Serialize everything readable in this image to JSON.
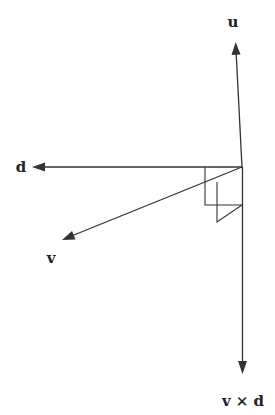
{
  "diagram": {
    "title": "",
    "origin": {
      "x": 242,
      "y": 167
    },
    "vectors": [
      {
        "name": "u",
        "label": "u",
        "tip": {
          "x": 236,
          "y": 44
        },
        "label_pos": {
          "x": 233,
          "y": 27
        }
      },
      {
        "name": "d",
        "label": "d",
        "tip": {
          "x": 33,
          "y": 167
        },
        "label_pos": {
          "x": 18,
          "y": 172
        }
      },
      {
        "name": "v",
        "label": "v",
        "tip": {
          "x": 62,
          "y": 240
        },
        "label_pos": {
          "x": 50,
          "y": 262
        }
      },
      {
        "name": "v-cross-d",
        "label": "v × d",
        "tip": {
          "x": 243,
          "y": 374
        },
        "label_pos": {
          "x": 243,
          "y": 405
        }
      }
    ],
    "auxiliary_lines": [
      {
        "name": "parallelogram-1",
        "points": [
          [
            205,
            167
          ],
          [
            205,
            205
          ],
          [
            242,
            205
          ]
        ]
      },
      {
        "name": "parallelogram-2",
        "points": [
          [
            217,
            180
          ],
          [
            217,
            222
          ],
          [
            242,
            205
          ]
        ]
      }
    ],
    "colors": {
      "stroke": "#333333",
      "text": "#222222",
      "background": "#ffffff"
    }
  }
}
